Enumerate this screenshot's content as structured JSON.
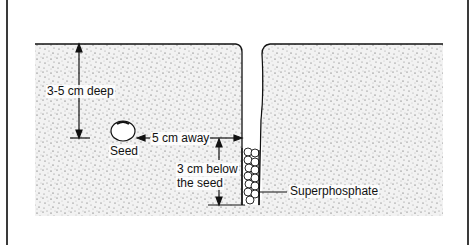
{
  "diagram": {
    "labels": {
      "depth": "3-5 cm deep",
      "seed": "Seed",
      "distance": "5 cm away",
      "below_line1": "3 cm below",
      "below_line2": "the seed",
      "fertilizer": "Superphosphate"
    },
    "colors": {
      "soil_dots": "#555555",
      "line": "#111111",
      "background": "#ffffff"
    }
  }
}
